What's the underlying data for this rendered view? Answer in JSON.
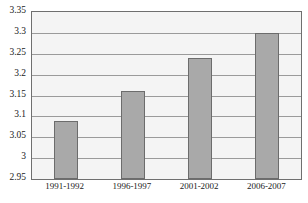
{
  "chart_data": {
    "type": "bar",
    "title": "",
    "xlabel": "",
    "ylabel": "",
    "categories": [
      "1991-1992",
      "1996-1997",
      "2001-2002",
      "2006-2007"
    ],
    "values": [
      3.09,
      3.16,
      3.24,
      3.3
    ],
    "ylim": [
      2.95,
      3.35
    ],
    "ytick_step": 0.05,
    "yticks": [
      3.35,
      3.3,
      3.25,
      3.2,
      3.15,
      3.1,
      3.05,
      3,
      2.95
    ],
    "ytick_labels": [
      "3.35",
      "3.3",
      "3.25",
      "3.2",
      "3.15",
      "3.1",
      "3.05",
      "3",
      "2.95"
    ],
    "grid": true,
    "legend": false,
    "legend_position": "none",
    "series": [
      {
        "name": "",
        "values": [
          3.09,
          3.16,
          3.24,
          3.3
        ]
      }
    ],
    "colors": {
      "bar_fill": "#a9a9a9",
      "bar_border": "#6c6c6c",
      "plot_background": "#f4f4f4",
      "gridline": "#9a9a9a",
      "axis_border": "#6f6f6f",
      "text": "#1b1b1b"
    }
  },
  "title_remnant": ""
}
